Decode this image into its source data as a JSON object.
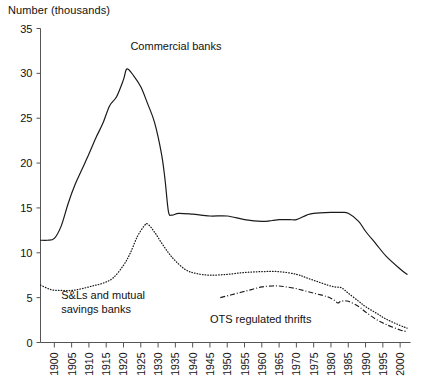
{
  "chart_data": {
    "type": "line",
    "title": "Number (thousands)",
    "xlabel": "",
    "ylabel": "Number (thousands)",
    "ylim": [
      0,
      35
    ],
    "xlim": [
      1896,
      2003
    ],
    "grid": false,
    "legend_position": "inline-annotations",
    "ytick_labels": [
      "0",
      "5",
      "10",
      "15",
      "20",
      "25",
      "30",
      "35"
    ],
    "ytick_values": [
      0,
      5,
      10,
      15,
      20,
      25,
      30,
      35
    ],
    "xtick_labels": [
      "1900",
      "1905",
      "1910",
      "1915",
      "1920",
      "1925",
      "1930",
      "1935",
      "1940",
      "1945",
      "1950",
      "1955",
      "1960",
      "1965",
      "1970",
      "1975",
      "1980",
      "1985",
      "1990",
      "1995",
      "2000"
    ],
    "xtick_values": [
      1900,
      1905,
      1910,
      1915,
      1920,
      1925,
      1930,
      1935,
      1940,
      1945,
      1950,
      1955,
      1960,
      1965,
      1970,
      1975,
      1980,
      1985,
      1990,
      1995,
      2000
    ],
    "annotations": [
      {
        "text": "Commercial banks",
        "x": 1922,
        "y": 32.6
      },
      {
        "text": "S&Ls and mutual",
        "x": 1902,
        "y": 4.9
      },
      {
        "text": "savings banks",
        "x": 1902,
        "y": 3.3
      },
      {
        "text": "OTS regulated thrifts",
        "x": 1945,
        "y": 2.2
      }
    ],
    "series": [
      {
        "name": "Commercial banks",
        "style": "solid",
        "color": "#1a1a1a",
        "x": [
          1896,
          1898,
          1900,
          1902,
          1904,
          1906,
          1908,
          1910,
          1912,
          1914,
          1916,
          1918,
          1920,
          1921,
          1923,
          1925,
          1927,
          1929,
          1931,
          1932,
          1933,
          1934,
          1936,
          1940,
          1945,
          1950,
          1955,
          1960,
          1963,
          1965,
          1968,
          1970,
          1973,
          1975,
          1980,
          1983,
          1985,
          1988,
          1990,
          1993,
          1996,
          2000,
          2002
        ],
        "y": [
          11.4,
          11.4,
          11.6,
          13.0,
          15.5,
          17.6,
          19.3,
          21.0,
          22.8,
          24.4,
          26.4,
          27.4,
          29.3,
          30.5,
          29.7,
          28.5,
          26.6,
          24.5,
          21.0,
          18.2,
          14.6,
          14.2,
          14.4,
          14.3,
          14.1,
          14.1,
          13.7,
          13.5,
          13.6,
          13.7,
          13.7,
          13.7,
          14.2,
          14.4,
          14.5,
          14.5,
          14.4,
          13.5,
          12.4,
          11.0,
          9.6,
          8.2,
          7.6
        ]
      },
      {
        "name": "S&Ls and mutual savings banks",
        "style": "dotted",
        "color": "#1a1a1a",
        "x": [
          1896,
          1899,
          1902,
          1905,
          1908,
          1911,
          1914,
          1917,
          1920,
          1922,
          1924,
          1926,
          1927,
          1929,
          1931,
          1933,
          1935,
          1938,
          1941,
          1945,
          1950,
          1955,
          1960,
          1965,
          1970,
          1973,
          1976,
          1979,
          1981,
          1983,
          1985,
          1988,
          1990,
          1993,
          1996,
          2000,
          2002
        ],
        "y": [
          6.4,
          5.9,
          5.8,
          5.8,
          6.0,
          6.3,
          6.6,
          7.2,
          8.6,
          10.0,
          11.8,
          13.0,
          13.2,
          12.3,
          11.1,
          10.0,
          9.1,
          8.1,
          7.7,
          7.5,
          7.6,
          7.8,
          7.9,
          7.9,
          7.6,
          7.2,
          6.8,
          6.4,
          6.2,
          6.1,
          5.5,
          4.6,
          4.0,
          3.3,
          2.6,
          1.9,
          1.6
        ]
      },
      {
        "name": "OTS regulated thrifts",
        "style": "dashdot",
        "color": "#1a1a1a",
        "x": [
          1948,
          1951,
          1954,
          1957,
          1960,
          1963,
          1965,
          1967,
          1970,
          1973,
          1976,
          1979,
          1981,
          1982,
          1983,
          1985,
          1988,
          1990,
          1993,
          1996,
          2000,
          2002
        ],
        "y": [
          5.0,
          5.3,
          5.6,
          5.9,
          6.2,
          6.3,
          6.3,
          6.2,
          6.0,
          5.7,
          5.4,
          5.1,
          4.7,
          4.4,
          4.6,
          4.6,
          4.0,
          3.4,
          2.6,
          2.0,
          1.4,
          1.2
        ]
      }
    ]
  }
}
